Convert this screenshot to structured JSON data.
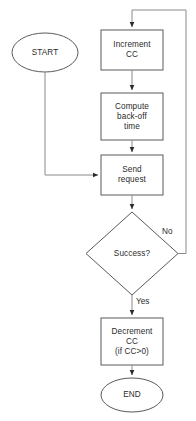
{
  "diagram": {
    "background_color": "#ffffff",
    "stroke_color": "#555555",
    "text_color": "#2b2b2b",
    "nodes": {
      "start": {
        "label": "START",
        "shape": "ellipse"
      },
      "increment_cc": {
        "label": "Increment\nCC",
        "shape": "rectangle"
      },
      "compute_backoff": {
        "label": "Compute\nback-off\ntime",
        "shape": "rectangle"
      },
      "send_request": {
        "label": "Send\nrequest",
        "shape": "rectangle"
      },
      "success_decision": {
        "label": "Success?",
        "shape": "diamond"
      },
      "decrement_cc": {
        "label": "Decrement\nCC\n(if CC>0)",
        "shape": "rectangle"
      },
      "end": {
        "label": "END",
        "shape": "ellipse"
      }
    },
    "edge_labels": {
      "no": "No",
      "yes": "Yes"
    }
  }
}
